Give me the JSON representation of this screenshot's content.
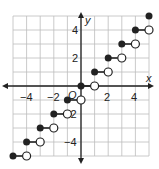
{
  "chart_data": {
    "type": "scatter",
    "title": "",
    "xlabel": "x",
    "ylabel": "y",
    "xlim": [
      -5,
      5
    ],
    "ylim": [
      -5,
      5
    ],
    "grid": true,
    "origin_label": "O",
    "x_ticks": [
      -4,
      -2,
      2,
      4
    ],
    "y_ticks": [
      4,
      2,
      -2,
      -4
    ],
    "x_tick_labels": [
      "−4",
      "−2",
      "2",
      "4"
    ],
    "y_tick_labels": [
      "4",
      "2",
      "−2",
      "−4"
    ],
    "function": "y = floor(x) (greatest integer function)",
    "segments": [
      {
        "closed": [
          -5,
          -5
        ],
        "open": [
          -4,
          -5
        ]
      },
      {
        "closed": [
          -4,
          -4
        ],
        "open": [
          -3,
          -4
        ]
      },
      {
        "closed": [
          -3,
          -3
        ],
        "open": [
          -2,
          -3
        ]
      },
      {
        "closed": [
          -2,
          -2
        ],
        "open": [
          -1,
          -2
        ]
      },
      {
        "closed": [
          -1,
          -1
        ],
        "open": [
          0,
          -1
        ]
      },
      {
        "closed": [
          0,
          0
        ],
        "open": [
          1,
          0
        ]
      },
      {
        "closed": [
          1,
          1
        ],
        "open": [
          2,
          1
        ]
      },
      {
        "closed": [
          2,
          2
        ],
        "open": [
          3,
          2
        ]
      },
      {
        "closed": [
          3,
          3
        ],
        "open": [
          4,
          3
        ]
      },
      {
        "closed": [
          4,
          4
        ],
        "open": [
          5,
          4
        ]
      },
      {
        "closed": [
          5,
          5
        ],
        "open": null
      }
    ]
  },
  "labels": {
    "x": "x",
    "y": "y",
    "origin": "O",
    "xm4": "−4",
    "xm2": "−2",
    "x2": "2",
    "x4": "4",
    "y4": "4",
    "y2": "2",
    "ym2": "−2",
    "ym4": "−4"
  }
}
